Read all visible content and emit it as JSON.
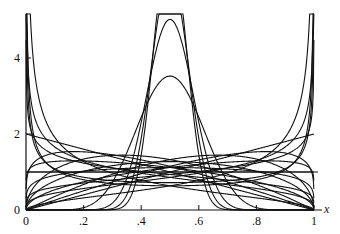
{
  "chart_data": {
    "type": "line",
    "title": "",
    "xlabel": "x",
    "ylabel": "",
    "xlim": [
      0,
      1
    ],
    "ylim": [
      0,
      5.2
    ],
    "grid": false,
    "x_ticks": [
      {
        "v": 0,
        "label": "0"
      },
      {
        "v": 0.2,
        "label": ".2"
      },
      {
        "v": 0.4,
        "label": ".4"
      },
      {
        "v": 0.6,
        "label": ".6"
      },
      {
        "v": 0.8,
        "label": ".8"
      },
      {
        "v": 1,
        "label": "1"
      }
    ],
    "y_ticks": [
      {
        "v": 0,
        "label": "0"
      },
      {
        "v": 2,
        "label": "2"
      },
      {
        "v": 4,
        "label": "4"
      }
    ],
    "series": [
      {
        "name": "Beta(0.5,0.5)",
        "a": 0.5,
        "b": 0.5
      },
      {
        "name": "Beta(0.6,0.6)",
        "a": 0.6,
        "b": 0.6
      },
      {
        "name": "Beta(1,1)",
        "a": 1,
        "b": 1
      },
      {
        "name": "Beta(10,10)",
        "a": 10,
        "b": 10
      },
      {
        "name": "Beta(20,20)",
        "a": 20,
        "b": 20
      },
      {
        "name": "Beta(30,30)",
        "a": 30,
        "b": 30
      },
      {
        "name": "Beta(40,40)",
        "a": 40,
        "b": 40
      },
      {
        "name": "Beta(1,2)",
        "a": 1,
        "b": 2
      },
      {
        "name": "Beta(2,1)",
        "a": 2,
        "b": 1
      },
      {
        "name": "Beta(1.2,2)",
        "a": 1.2,
        "b": 2
      },
      {
        "name": "Beta(2,1.2)",
        "a": 2,
        "b": 1.2
      },
      {
        "name": "Beta(1.5,2)",
        "a": 1.5,
        "b": 2
      },
      {
        "name": "Beta(2,1.5)",
        "a": 2,
        "b": 1.5
      },
      {
        "name": "Beta(1.5,1.5)",
        "a": 1.5,
        "b": 1.5
      },
      {
        "name": "Beta(1.2,1.2)",
        "a": 1.2,
        "b": 1.2
      },
      {
        "name": "Beta(1.1,1.5)",
        "a": 1.1,
        "b": 1.5
      },
      {
        "name": "Beta(1.5,1.1)",
        "a": 1.5,
        "b": 1.1
      },
      {
        "name": "Beta(0.7,1.3)",
        "a": 0.7,
        "b": 1.3
      },
      {
        "name": "Beta(1.3,0.7)",
        "a": 1.3,
        "b": 0.7
      },
      {
        "name": "Beta(0.5,1.5)",
        "a": 0.5,
        "b": 1.5
      },
      {
        "name": "Beta(1.5,0.5)",
        "a": 1.5,
        "b": 0.5
      },
      {
        "name": "Beta(0.8,1.2)",
        "a": 0.8,
        "b": 1.2
      },
      {
        "name": "Beta(1.2,0.8)",
        "a": 1.2,
        "b": 0.8
      }
    ],
    "horizontal_line": 1.0,
    "peak_values_at_x_0_5": [
      5.05,
      4.34,
      3.53,
      2.43,
      1.87,
      1.5,
      1.29,
      1.0,
      0.79,
      0.55
    ]
  }
}
